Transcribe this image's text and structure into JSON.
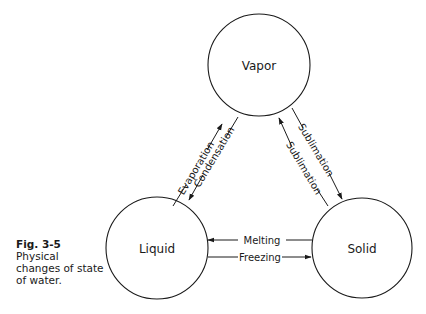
{
  "caption": {
    "figure_number": "Fig. 3-5",
    "text": "Physical changes of state of water."
  },
  "states": {
    "vapor": "Vapor",
    "liquid": "Liquid",
    "solid": "Solid"
  },
  "transitions": {
    "evaporation": "Evaporation",
    "condensation": "Condensation",
    "sublimation_up": "Sublimation",
    "sublimation_down": "Sublimation",
    "melting": "Melting",
    "freezing": "Freezing"
  },
  "colors": {
    "stroke": "#1a1a1a",
    "background": "#ffffff"
  }
}
